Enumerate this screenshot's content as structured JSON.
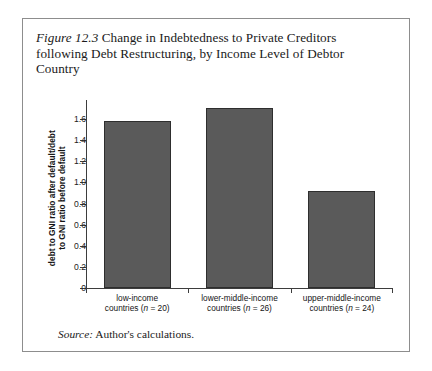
{
  "figure": {
    "number_label": "Figure 12.3",
    "title_text": " Change in Indebtedness to Private Creditors following Debt Restructuring, by Income Level of Debtor Country",
    "source_label": "Source:",
    "source_text": " Author's calculations."
  },
  "chart_data": {
    "type": "bar",
    "title": "Change in Indebtedness to Private Creditors following Debt Restructuring, by Income Level of Debtor Country",
    "categories": [
      "low-income countries (n = 20)",
      "lower-middle-income countries (n = 26)",
      "upper-middle-income countries (n = 24)"
    ],
    "category_lines": [
      [
        "low-income",
        "countries (n = 20)"
      ],
      [
        "lower-middle-income",
        "countries (n = 26)"
      ],
      [
        "upper-middle-income",
        "countries (n = 24)"
      ]
    ],
    "values": [
      1.58,
      1.7,
      0.92
    ],
    "xlabel": "",
    "ylabel": "debt to GNI ratio after default/debt to GNI ratio before default",
    "ylabel_lines": [
      "debt to GNI ratio after default/debt",
      "to GNI ratio before default"
    ],
    "ylim": [
      0,
      1.78
    ],
    "ytick_values": [
      0,
      0.2,
      0.4,
      0.6,
      0.8,
      1.0,
      1.2,
      1.4,
      1.6
    ],
    "ytick_labels": [
      "0",
      "0.2",
      "0.4",
      "0.6",
      "0.8",
      "1.0",
      "1.2",
      "1.4",
      "1.6"
    ],
    "grid": false,
    "legend": "none",
    "bar_color": "#5a5a5a",
    "bar_edge_color": "#2e2e2e"
  }
}
